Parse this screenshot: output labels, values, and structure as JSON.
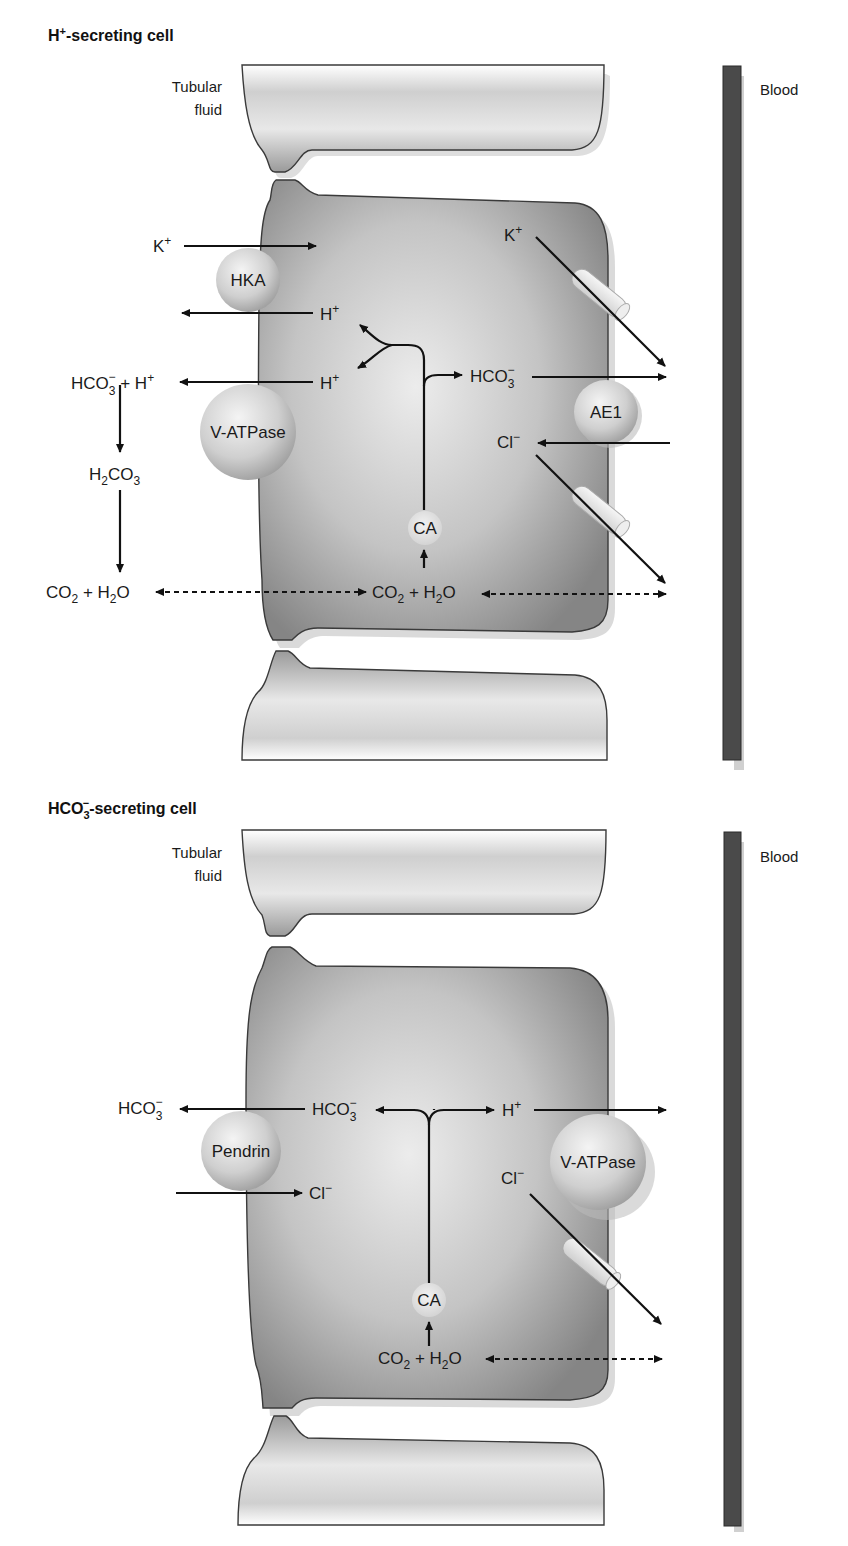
{
  "panels": [
    {
      "title_main": "H",
      "title_sup": "+",
      "title_rest": "-secreting cell",
      "tubular_label_line1": "Tubular",
      "tubular_label_line2": "fluid",
      "blood_label": "Blood",
      "transporters": {
        "hka": "HKA",
        "vatpase": "V-ATPase",
        "ae1": "AE1",
        "ca": "CA"
      },
      "labels": {
        "k_apical": "K",
        "k_apical_sup": "+",
        "h_upper": "H",
        "h_upper_sup": "+",
        "h_lower": "H",
        "h_lower_sup": "+",
        "lumen_hco3": "HCO",
        "lumen_hco3_sub": "3",
        "lumen_hco3_sup": "−",
        "lumen_plus_h": " + H",
        "lumen_plus_h_sup": "+",
        "h2co3_a": "H",
        "h2co3_sub1": "2",
        "h2co3_b": "CO",
        "h2co3_sub2": "3",
        "lumen_co2": "CO",
        "lumen_co2_sub": "2",
        "lumen_plus_h2o": " + H",
        "lumen_h2o_sub": "2",
        "lumen_h2o_o": "O",
        "cell_co2": "CO",
        "cell_co2_sub": "2",
        "cell_plus_h2o": " + H",
        "cell_h2o_sub": "2",
        "cell_h2o_o": "O",
        "cell_hco3": "HCO",
        "cell_hco3_sub": "3",
        "cell_hco3_sup": "−",
        "k_basolateral": "K",
        "k_basolateral_sup": "+",
        "cl_basolateral": "Cl",
        "cl_basolateral_sup": "−"
      }
    },
    {
      "title_main": "HCO",
      "title_sub": "3",
      "title_sup": "−",
      "title_rest": "-secreting cell",
      "tubular_label_line1": "Tubular",
      "tubular_label_line2": "fluid",
      "blood_label": "Blood",
      "transporters": {
        "pendrin": "Pendrin",
        "vatpase": "V-ATPase",
        "ca": "CA"
      },
      "labels": {
        "lumen_hco3": "HCO",
        "lumen_hco3_sub": "3",
        "lumen_hco3_sup": "−",
        "cell_hco3": "HCO",
        "cell_hco3_sub": "3",
        "cell_hco3_sup": "−",
        "cl_apical": "Cl",
        "cl_apical_sup": "−",
        "h": "H",
        "h_sup": "+",
        "cl_basolateral": "Cl",
        "cl_basolateral_sup": "−",
        "cell_co2": "CO",
        "cell_co2_sub": "2",
        "cell_plus_h2o": " + H",
        "cell_h2o_sub": "2",
        "cell_h2o_o": "O"
      }
    }
  ],
  "colors": {
    "cell_fill_dark": "#8a8a8a",
    "cell_fill_light": "#e6e6e6",
    "blood_vessel": "#4a4a4a",
    "transporter_fill": "#d8d8d8"
  }
}
